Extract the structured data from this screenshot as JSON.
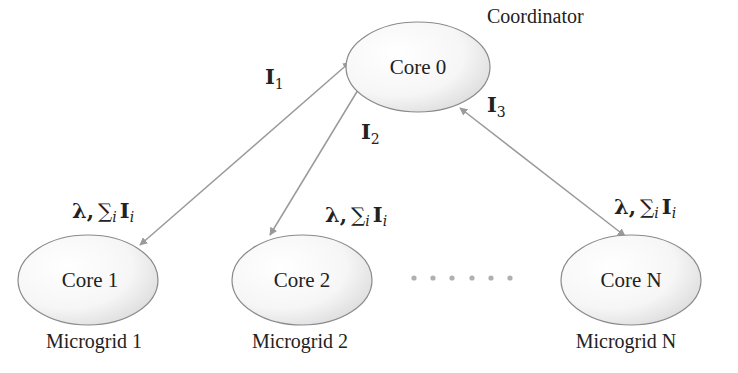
{
  "diagram": {
    "coordinator": {
      "node_label": "Core 0",
      "role_label": "Coordinator"
    },
    "workers": [
      {
        "node_label": "Core 1",
        "group_label": "Microgrid 1"
      },
      {
        "node_label": "Core 2",
        "group_label": "Microgrid 2"
      },
      {
        "node_label": "Core N",
        "group_label": "Microgrid N"
      }
    ],
    "uplinks": [
      {
        "symbol": "I",
        "subscript": "1"
      },
      {
        "symbol": "I",
        "subscript": "2"
      },
      {
        "symbol": "I",
        "subscript": "3"
      }
    ],
    "downlink": {
      "lambda": "λ,",
      "sum": "∑",
      "sum_index": "i",
      "symbol": "I",
      "subscript": "i"
    },
    "ellipsis": "• • • • • •",
    "colors": {
      "arrow": "#9a9a9a",
      "node_border": "#8a8a8a",
      "node_fill_light": "#ffffff",
      "node_fill_dark": "#cfcfcf",
      "dots": "#b0b0b0",
      "text": "#222222"
    }
  }
}
